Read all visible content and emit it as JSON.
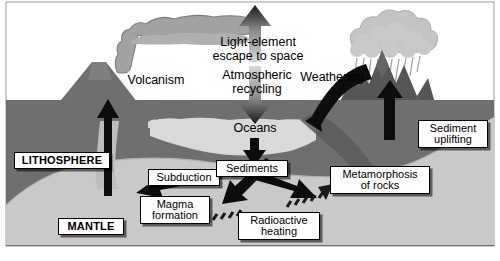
{
  "figure": {
    "type": "diagram",
    "width": 500,
    "height": 261
  },
  "colors": {
    "sky": "#ffffff",
    "lithosphere": "#6f6f6f",
    "mantle": "#c9c9c9",
    "mountains": "#565656",
    "ocean": "#d9d9d9",
    "plume": "#9d9d9d",
    "cloud": "#c4c4c4",
    "magma_conduit": "#bdbdbd",
    "arrow_dark": "#000000",
    "label_bg": "#ffffff",
    "label_border": "#000000",
    "outline": "#000000"
  },
  "plain_labels": [
    {
      "id": "volcanism",
      "text": "Volcanism"
    },
    {
      "id": "light-element-escape",
      "text": "Light-element\nescape to space"
    },
    {
      "id": "atmospheric-recycling",
      "text": "Atmospheric\nrecycling"
    },
    {
      "id": "weathering",
      "text": "Weathering"
    },
    {
      "id": "oceans",
      "text": "Oceans"
    }
  ],
  "boxed_labels": [
    {
      "id": "lithosphere",
      "text": "LITHOSPHERE",
      "bold": true
    },
    {
      "id": "mantle",
      "text": "MANTLE",
      "bold": true
    },
    {
      "id": "subduction",
      "text": "Subduction",
      "bold": false
    },
    {
      "id": "magma-formation",
      "text": "Magma\nformation",
      "bold": false
    },
    {
      "id": "sediments",
      "text": "Sediments",
      "bold": false
    },
    {
      "id": "metamorphosis-of-rocks",
      "text": "Metamorphosis\nof rocks",
      "bold": false
    },
    {
      "id": "radioactive-heating",
      "text": "Radioactive\nheating",
      "bold": false
    },
    {
      "id": "sediment-uplifting",
      "text": "Sediment\nuplifting",
      "bold": false
    }
  ],
  "features": [
    {
      "id": "volcano-cone",
      "kind": "landform"
    },
    {
      "id": "volcanic-plume",
      "kind": "emission"
    },
    {
      "id": "rain-cloud",
      "kind": "weather"
    },
    {
      "id": "rain-streaks",
      "kind": "weather"
    },
    {
      "id": "mountain-range",
      "kind": "landform"
    },
    {
      "id": "ocean-basin",
      "kind": "water"
    },
    {
      "id": "mantle-region",
      "kind": "interior"
    },
    {
      "id": "lithosphere-region",
      "kind": "interior"
    },
    {
      "id": "subducting-slab",
      "kind": "interior"
    },
    {
      "id": "magma-conduit",
      "kind": "interior"
    }
  ],
  "arrows": [
    {
      "id": "magma-ascent-arrow",
      "direction": "up"
    },
    {
      "id": "escape-to-space-arrow",
      "direction": "up"
    },
    {
      "id": "atmospheric-recycling-arrow",
      "direction": "down"
    },
    {
      "id": "weathering-arrow",
      "direction": "down-left-curve"
    },
    {
      "id": "uplift-arrow",
      "direction": "up"
    },
    {
      "id": "ocean-to-sediments-arrow",
      "direction": "down"
    },
    {
      "id": "sediments-to-subduction-arrow",
      "direction": "down-left"
    },
    {
      "id": "sediments-to-metamorphosis-arrow",
      "direction": "down-right"
    },
    {
      "id": "subduction-to-magma-arrow",
      "direction": "down-left"
    },
    {
      "id": "radioactive-heating-arrow",
      "direction": "up-right-dashed"
    }
  ]
}
